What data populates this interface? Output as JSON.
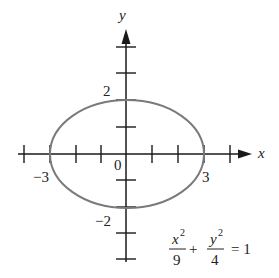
{
  "diagram": {
    "type": "ellipse-graph",
    "equation": {
      "term1_num": "x",
      "term1_exp": "2",
      "term1_den": "9",
      "plus": "+",
      "term2_num": "y",
      "term2_exp": "2",
      "term2_den": "4",
      "equals": "= 1"
    },
    "axes": {
      "x_label": "x",
      "y_label": "y",
      "origin_label": "0"
    },
    "tick_labels": {
      "x_neg": "−3",
      "x_pos": "3",
      "y_pos": "2",
      "y_neg": "−2"
    },
    "ellipse": {
      "a": 3,
      "b": 2,
      "color": "#7a7a7a"
    },
    "axis_color": "#1a1a1a"
  }
}
